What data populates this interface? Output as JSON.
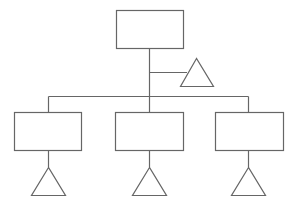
{
  "diagram": {
    "type": "hierarchy-tree",
    "stroke_color": "#666666",
    "background": "#ffffff",
    "root": {
      "shape": "rectangle",
      "label": "",
      "side_attachment": {
        "shape": "triangle",
        "label": ""
      }
    },
    "children": [
      {
        "shape": "rectangle",
        "label": "",
        "attachment": {
          "shape": "triangle",
          "label": ""
        }
      },
      {
        "shape": "rectangle",
        "label": "",
        "attachment": {
          "shape": "triangle",
          "label": ""
        }
      },
      {
        "shape": "rectangle",
        "label": "",
        "attachment": {
          "shape": "triangle",
          "label": ""
        }
      }
    ]
  }
}
